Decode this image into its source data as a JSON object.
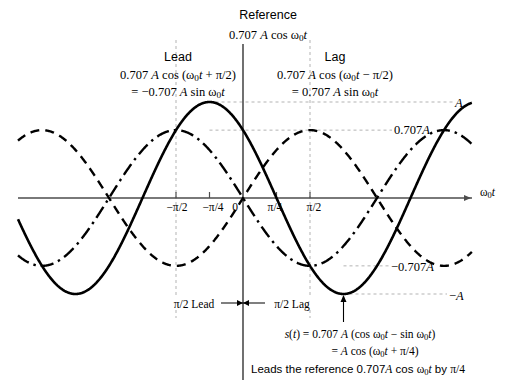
{
  "figure": {
    "title_top": "Reference",
    "reference_expr": "0.707 A cos ω0t",
    "lead": {
      "heading": "Lead",
      "line1": "0.707 A cos (ω0t + π/2)",
      "line2": "= −0.707 A sin ω0t"
    },
    "lag": {
      "heading": "Lag",
      "line1": "0.707 A cos (ω0t − π/2)",
      "line2": "= 0.707 A sin ω0t"
    },
    "result": {
      "line1": "s(t) = 0.707 A (cos ω0t − sin ω0t)",
      "line2": "= A cos (ω0t + π/4)",
      "line3": "Leads the reference 0.707A cos ω0t by π/4"
    },
    "span_labels": {
      "lead": "π/2 Lead",
      "lag": "π/2 Lag"
    },
    "axis": {
      "x_axis_label": "ω0t",
      "x_ticks": [
        "−π/2",
        "−π/4",
        "0",
        "π/4",
        "π/2"
      ],
      "y_levels": [
        "A",
        "0.707A",
        "−0.707A",
        "−A"
      ]
    },
    "colors": {
      "curve": "#000000",
      "axis": "#4d4d4d",
      "guide": "#b3b3b3"
    }
  },
  "chart_data": {
    "type": "line",
    "xlabel": "ω0t",
    "ylabel": "amplitude",
    "xlim": [
      -2.5132741228718345,
      4.39822971502571
    ],
    "ylim": [
      -1.12,
      1.12
    ],
    "x_tick_values": [
      -1.5707963267948966,
      -0.7853981633974483,
      0,
      0.7853981633974483,
      1.5707963267948966
    ],
    "x_tick_labels": [
      "−π/2",
      "−π/4",
      "0",
      "π/4",
      "π/2"
    ],
    "y_tick_values": [
      1,
      0.707,
      -0.707,
      -1
    ],
    "y_tick_labels": [
      "A",
      "0.707A",
      "−0.707A",
      "−A"
    ],
    "grid": false,
    "legend": "none",
    "series": [
      {
        "name": "s(t) = A cos (ω0t + π/4)",
        "style": "solid",
        "amplitude": 1.0,
        "phase": 0.7853981633974483,
        "form": "A*cos(w0t + pi/4)",
        "peak_x": -0.7853981633974483,
        "peak_y": 1.0,
        "trough_x": 2.356194490192345,
        "trough_y": -1.0,
        "zero_crossings": [
          0.7853981633974483,
          -2.356194490192345
        ]
      },
      {
        "name": "Lead: 0.707 A cos (ω0t + π/2) = −0.707 A sin ω0t",
        "style": "dash-dot",
        "amplitude": 0.707,
        "phase": 1.5707963267948966,
        "form": "0.707*A*cos(w0t + pi/2)",
        "peak_x": -1.5707963267948966,
        "peak_y": 0.707,
        "trough_x": 1.5707963267948966,
        "trough_y": -0.707,
        "zero_crossings": [
          0,
          3.141592653589793,
          -3.141592653589793
        ]
      },
      {
        "name": "Lag: 0.707 A cos (ω0t − π/2) = 0.707 A sin ω0t",
        "style": "dashed",
        "amplitude": 0.707,
        "phase": -1.5707963267948966,
        "form": "0.707*A*cos(w0t - pi/2)",
        "peak_x": 1.5707963267948966,
        "peak_y": 0.707,
        "trough_x": -1.5707963267948966,
        "trough_y": -0.707,
        "zero_crossings": [
          0,
          3.141592653589793,
          -3.141592653589793
        ]
      }
    ],
    "annotations": [
      {
        "text": "Reference 0.707 A cos ω0t",
        "at_x": 0
      },
      {
        "text": "π/2 Lead",
        "from_x": -1.5707963267948966,
        "to_x": 0
      },
      {
        "text": "π/2 Lag",
        "from_x": 0,
        "to_x": 1.5707963267948966
      }
    ]
  }
}
